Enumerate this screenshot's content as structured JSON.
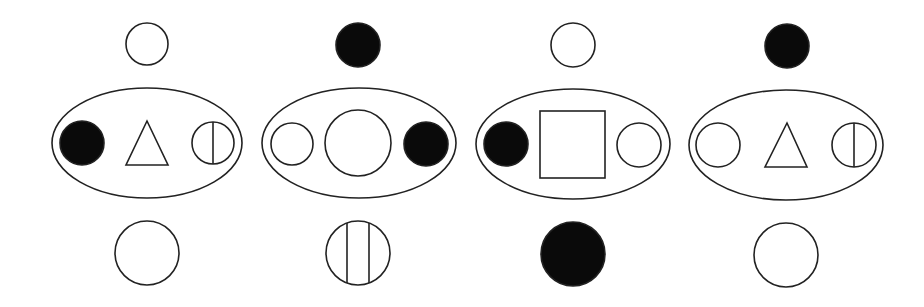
{
  "style": {
    "stroke": "#222222",
    "fill_black": "#0a0a0a",
    "background": "#ffffff",
    "stroke_width": 1.6
  },
  "panels": [
    {
      "id": "panel-1",
      "top": {
        "shape": "circle",
        "fill": "white",
        "cx": 147,
        "cy": 44,
        "r": 21
      },
      "ellipse": {
        "cx": 147,
        "cy": 143,
        "rx": 95,
        "ry": 55
      },
      "inner": [
        {
          "shape": "circle",
          "fill": "black",
          "cx": 82,
          "cy": 143,
          "r": 22
        },
        {
          "shape": "triangle",
          "fill": "white",
          "points": "147,121 126,165 168,165"
        },
        {
          "shape": "circle-vline",
          "fill": "white",
          "cx": 213,
          "cy": 143,
          "r": 21,
          "lines": [
            213
          ]
        }
      ],
      "bottom": {
        "shape": "circle",
        "fill": "white",
        "cx": 147,
        "cy": 253,
        "r": 32
      }
    },
    {
      "id": "panel-2",
      "top": {
        "shape": "circle",
        "fill": "black",
        "cx": 358,
        "cy": 45,
        "r": 22
      },
      "ellipse": {
        "cx": 359,
        "cy": 143,
        "rx": 97,
        "ry": 55
      },
      "inner": [
        {
          "shape": "circle",
          "fill": "white",
          "cx": 292,
          "cy": 144,
          "r": 21
        },
        {
          "shape": "circle",
          "fill": "white",
          "cx": 358,
          "cy": 143,
          "r": 33
        },
        {
          "shape": "circle",
          "fill": "black",
          "cx": 426,
          "cy": 144,
          "r": 22
        }
      ],
      "bottom": {
        "shape": "circle-vline",
        "fill": "white",
        "cx": 358,
        "cy": 253,
        "r": 32,
        "lines": [
          347,
          369
        ]
      }
    },
    {
      "id": "panel-3",
      "top": {
        "shape": "circle",
        "fill": "white",
        "cx": 573,
        "cy": 45,
        "r": 22
      },
      "ellipse": {
        "cx": 573,
        "cy": 144,
        "rx": 97,
        "ry": 55
      },
      "inner": [
        {
          "shape": "circle",
          "fill": "black",
          "cx": 506,
          "cy": 144,
          "r": 22
        },
        {
          "shape": "square",
          "fill": "white",
          "x": 540,
          "y": 111,
          "w": 65,
          "h": 67
        },
        {
          "shape": "circle",
          "fill": "white",
          "cx": 639,
          "cy": 145,
          "r": 22
        }
      ],
      "bottom": {
        "shape": "circle",
        "fill": "black",
        "cx": 573,
        "cy": 254,
        "r": 32
      }
    },
    {
      "id": "panel-4",
      "top": {
        "shape": "circle",
        "fill": "black",
        "cx": 787,
        "cy": 46,
        "r": 22
      },
      "ellipse": {
        "cx": 786,
        "cy": 145,
        "rx": 97,
        "ry": 55
      },
      "inner": [
        {
          "shape": "circle",
          "fill": "white",
          "cx": 718,
          "cy": 145,
          "r": 22
        },
        {
          "shape": "triangle",
          "fill": "white",
          "points": "787,123 765,167 807,167"
        },
        {
          "shape": "circle-vline",
          "fill": "white",
          "cx": 854,
          "cy": 145,
          "r": 22,
          "lines": [
            854
          ]
        }
      ],
      "bottom": {
        "shape": "circle",
        "fill": "white",
        "cx": 786,
        "cy": 255,
        "r": 32
      }
    }
  ]
}
